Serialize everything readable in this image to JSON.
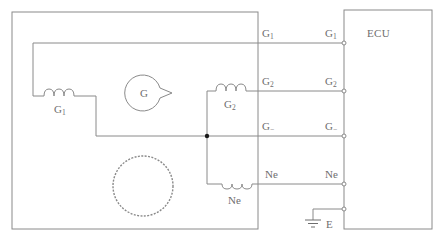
{
  "diagram": {
    "title": "",
    "colors": {
      "line": "#8a8a8a",
      "text": "#6e6e6e",
      "junction": "#1a1a1a",
      "background": "#ffffff"
    },
    "ecu": {
      "label": "ECU"
    },
    "sensor": {
      "signal_rotor_label": "G",
      "pickup_coils": [
        {
          "id": "g1",
          "label": "G",
          "sub": "1"
        },
        {
          "id": "g2",
          "label": "G",
          "sub": "2"
        },
        {
          "id": "ne",
          "label": "Ne",
          "sub": ""
        }
      ],
      "ne_rotor": "toothed-rotor-icon"
    },
    "lines": [
      {
        "id": "g1",
        "sensor_side": {
          "label": "G",
          "sub": "1"
        },
        "ecu_side": {
          "label": "G",
          "sub": "1"
        }
      },
      {
        "id": "g2",
        "sensor_side": {
          "label": "G",
          "sub": "2"
        },
        "ecu_side": {
          "label": "G",
          "sub": "2"
        }
      },
      {
        "id": "gminus",
        "sensor_side": {
          "label": "G",
          "sub": "−"
        },
        "ecu_side": {
          "label": "G",
          "sub": "−"
        }
      },
      {
        "id": "ne",
        "sensor_side": {
          "label": "Ne",
          "sub": ""
        },
        "ecu_side": {
          "label": "Ne",
          "sub": ""
        }
      }
    ],
    "ground": {
      "label": "E",
      "icon": "ground-icon"
    }
  }
}
